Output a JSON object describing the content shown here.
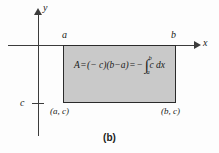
{
  "figure": {
    "caption": "(b)",
    "axes": {
      "y_label": "y",
      "x_label": "x",
      "c_tick_label": "c"
    },
    "marks": {
      "a_label": "a",
      "b_label": "b"
    },
    "region": {
      "fill_color": "#c9c9c9",
      "stroke_color": "#2b2b2b",
      "corner_bottom_left": "(a, c)",
      "corner_bottom_right": "(b, c)"
    },
    "formula": {
      "area_symbol": "A",
      "equals_1": "=",
      "product": "(− c)(b−a)",
      "equals_2": "=",
      "minus": "−",
      "integral_symbol": "∫",
      "limit_lower": "a",
      "limit_upper": "b",
      "integrand": "c dx",
      "full_text": "A = (− c)(b−a) = −∫ₐᵇ c dx"
    }
  },
  "chart_data": {
    "type": "area",
    "title": "(b)",
    "xlabel": "x",
    "ylabel": "y",
    "x": [
      "a",
      "b"
    ],
    "y_constant": "c",
    "region_corners": [
      "(a, 0)",
      "(b, 0)",
      "(b, c)",
      "(a, c)"
    ],
    "grid": false,
    "legend": "none"
  }
}
